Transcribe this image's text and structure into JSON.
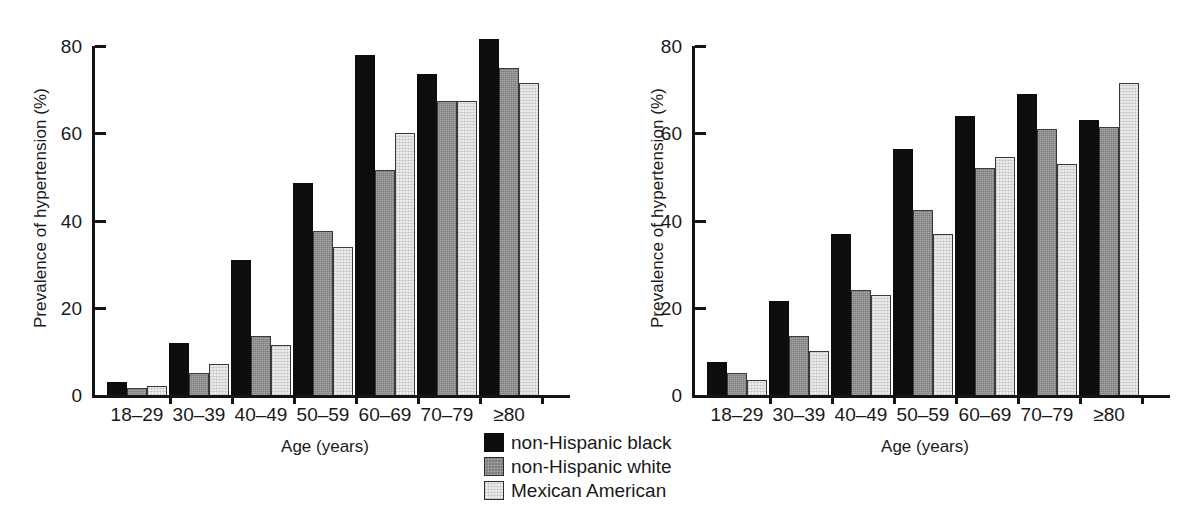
{
  "chart_data": [
    {
      "type": "bar",
      "panel": "left",
      "title": "",
      "xlabel": "Age (years)",
      "ylabel": "Prevalence of hypertension (%)",
      "categories": [
        "18–29",
        "30–39",
        "40–49",
        "50–59",
        "60–69",
        "70–79",
        "≥80"
      ],
      "ylim": [
        0,
        80
      ],
      "yticks": [
        0,
        20,
        40,
        60,
        80
      ],
      "ytick_labels": [
        "0",
        "20",
        "40",
        "60",
        "80"
      ],
      "grid": false,
      "series": [
        {
          "name": "non-Hispanic black",
          "color": "#0d0d0d",
          "values": [
            3,
            12,
            31,
            48.5,
            78,
            73.5,
            81.5
          ]
        },
        {
          "name": "non-Hispanic white",
          "color": "#7d7d7d",
          "values": [
            1.5,
            5,
            13.5,
            37.5,
            51.5,
            67.5,
            75
          ]
        },
        {
          "name": "Mexican American",
          "color": "#ececec",
          "values": [
            2,
            7,
            11.5,
            34,
            60,
            67.5,
            71.5
          ]
        }
      ]
    },
    {
      "type": "bar",
      "panel": "right",
      "title": "",
      "xlabel": "Age (years)",
      "ylabel": "Prevalence of hypertension (%)",
      "categories": [
        "18–29",
        "30–39",
        "40–49",
        "50–59",
        "60–69",
        "70–79",
        "≥80"
      ],
      "ylim": [
        0,
        80
      ],
      "yticks": [
        0,
        20,
        40,
        60,
        80
      ],
      "ytick_labels": [
        "0",
        "20",
        "40",
        "60",
        "80"
      ],
      "grid": false,
      "series": [
        {
          "name": "non-Hispanic black",
          "color": "#0d0d0d",
          "values": [
            7.5,
            21.5,
            37,
            56.5,
            64,
            69,
            63
          ]
        },
        {
          "name": "non-Hispanic white",
          "color": "#7d7d7d",
          "values": [
            5,
            13.5,
            24,
            42.5,
            52,
            61,
            61.5
          ]
        },
        {
          "name": "Mexican American",
          "color": "#ececec",
          "values": [
            3.5,
            10,
            23,
            37,
            54.5,
            53,
            71.5
          ]
        }
      ]
    }
  ],
  "legend": {
    "position": "bottom-center",
    "entries": [
      {
        "label": "non-Hispanic black",
        "color": "#0d0d0d"
      },
      {
        "label": "non-Hispanic white",
        "color": "#7d7d7d"
      },
      {
        "label": "Mexican American",
        "color": "#ececec"
      }
    ]
  }
}
